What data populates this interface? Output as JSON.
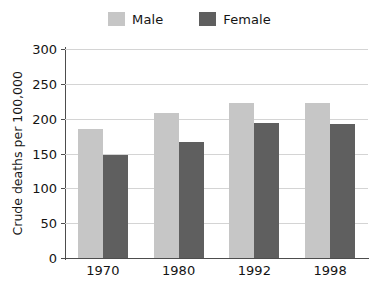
{
  "chart_data": {
    "type": "bar",
    "title": "",
    "subtitle": "",
    "xlabel": "",
    "ylabel": "Crude deaths per 100,000",
    "categories": [
      "1970",
      "1980",
      "1992",
      "1998"
    ],
    "series": [
      {
        "name": "Male",
        "color": "#c6c6c6",
        "values": [
          185,
          208,
          222,
          222
        ]
      },
      {
        "name": "Female",
        "color": "#5f5f5f",
        "values": [
          148,
          166,
          194,
          192
        ]
      }
    ],
    "ylim": [
      0,
      300
    ],
    "ytick_labels": [
      "0",
      "50",
      "100",
      "150",
      "200",
      "250",
      "300"
    ],
    "ytick_values": [
      0,
      50,
      100,
      150,
      200,
      250,
      300
    ],
    "grid": true,
    "grid_axis": "y",
    "legend_position": "top-center",
    "bar_grouping": "grouped",
    "annotations": []
  },
  "legend": {
    "entries": [
      {
        "label": "Male",
        "color": "#c6c6c6"
      },
      {
        "label": "Female",
        "color": "#5f5f5f"
      }
    ]
  },
  "axes": {
    "y_title": "Crude deaths per 100,000",
    "y_ticks": [
      "300",
      "250",
      "200",
      "150",
      "100",
      "50",
      "0"
    ],
    "x_ticks": [
      "1970",
      "1980",
      "1992",
      "1998"
    ]
  },
  "colors": {
    "background": "#ffffff",
    "axis": "#4d4d4d",
    "gridline": "#d4d4d4",
    "text": "#141414",
    "male_bar": "#c6c6c6",
    "female_bar": "#5f5f5f"
  }
}
